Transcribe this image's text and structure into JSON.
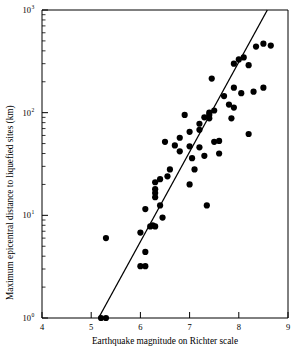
{
  "chart_data": {
    "type": "scatter",
    "title": "",
    "xlabel": "Earthquake magnitude on Richter scale",
    "ylabel": "Maximum epicentral distance to liquefied sites (km)",
    "xlim": [
      4,
      9
    ],
    "ylim": [
      1,
      1000
    ],
    "yscale": "log",
    "xscale": "linear",
    "grid": false,
    "legend": null,
    "xticks": [
      "4",
      "5",
      "6",
      "7",
      "8",
      "9"
    ],
    "yticks": [
      "10⁰",
      "10¹",
      "10²",
      "10³"
    ],
    "ytick_values": [
      1,
      10,
      100,
      1000
    ],
    "marker": "filled-circle",
    "marker_color": "#000000",
    "series": [
      {
        "name": "Liquefaction sites",
        "points": [
          [
            5.2,
            1.0
          ],
          [
            5.3,
            1.0
          ],
          [
            5.3,
            6.0
          ],
          [
            6.0,
            3.2
          ],
          [
            6.1,
            3.2
          ],
          [
            6.1,
            4.4
          ],
          [
            6.0,
            6.8
          ],
          [
            6.2,
            7.8
          ],
          [
            6.3,
            7.8
          ],
          [
            6.1,
            11.5
          ],
          [
            6.4,
            12.5
          ],
          [
            6.3,
            15.0
          ],
          [
            6.3,
            16.5
          ],
          [
            6.3,
            18.0
          ],
          [
            6.3,
            21.0
          ],
          [
            6.4,
            22.5
          ],
          [
            6.5,
            52.0
          ],
          [
            6.6,
            28.0
          ],
          [
            6.7,
            48.0
          ],
          [
            6.8,
            57.0
          ],
          [
            6.8,
            42.0
          ],
          [
            6.9,
            95.0
          ],
          [
            7.0,
            65.0
          ],
          [
            7.0,
            47.0
          ],
          [
            7.0,
            20.0
          ],
          [
            7.1,
            28.0
          ],
          [
            7.2,
            78.0
          ],
          [
            7.2,
            68.0
          ],
          [
            7.2,
            46.0
          ],
          [
            7.3,
            90.0
          ],
          [
            7.3,
            38.0
          ],
          [
            7.35,
            12.5
          ],
          [
            7.4,
            100.0
          ],
          [
            7.4,
            95.0
          ],
          [
            7.4,
            88.0
          ],
          [
            7.45,
            215.0
          ],
          [
            7.5,
            105.0
          ],
          [
            7.5,
            52.0
          ],
          [
            7.6,
            53.0
          ],
          [
            7.7,
            145.0
          ],
          [
            7.8,
            120.0
          ],
          [
            7.85,
            88.0
          ],
          [
            7.9,
            300.0
          ],
          [
            7.9,
            175.0
          ],
          [
            8.0,
            330.0
          ],
          [
            8.05,
            155.0
          ],
          [
            8.1,
            345.0
          ],
          [
            8.2,
            290.0
          ],
          [
            8.3,
            160.0
          ],
          [
            8.5,
            175.0
          ],
          [
            8.5,
            470.0
          ],
          [
            8.65,
            450.0
          ],
          [
            8.35,
            440.0
          ],
          [
            8.2,
            62.0
          ],
          [
            7.6,
            40.0
          ],
          [
            6.55,
            24.0
          ],
          [
            6.45,
            9.5
          ],
          [
            6.25,
            8.0
          ],
          [
            7.05,
            36.0
          ],
          [
            7.9,
            112.0
          ]
        ]
      }
    ],
    "fit_line": {
      "name": "trend-line",
      "x_start": 5.15,
      "y_start": 1.0,
      "x_end": 8.58,
      "y_end": 1000.0,
      "color": "#000000"
    }
  }
}
